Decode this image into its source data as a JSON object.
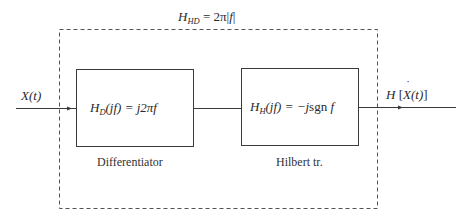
{
  "title": {
    "lhs_main": "H",
    "lhs_sub": "HD",
    "rhs": "= 2π|",
    "rhs_var": "f",
    "rhs_end": "|"
  },
  "input": {
    "label_main": "X",
    "label_arg": "(t)"
  },
  "output": {
    "label_H": "H",
    "label_open": "[",
    "label_main": "X",
    "label_arg": "(t)",
    "label_close": "]"
  },
  "blocks": [
    {
      "name": "Differentiator",
      "caption": "Differentiator",
      "tf_main": "H",
      "tf_sub": "D",
      "tf_arg": "(jf)",
      "tf_eq": "= j2πf"
    },
    {
      "name": "Hilbert transformer",
      "caption": "Hilbert tr.",
      "tf_main": "H",
      "tf_sub": "H",
      "tf_arg": "(jf)",
      "tf_eq": "= −j",
      "tf_fn": "sgn",
      "tf_var": " f"
    }
  ],
  "colors": {
    "line": "#3a3a3a",
    "dashed": "#555555",
    "background": "#ffffff"
  }
}
